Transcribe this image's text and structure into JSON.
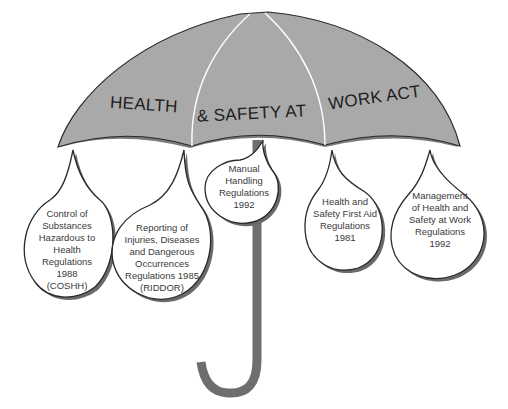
{
  "umbrella": {
    "title_parts": [
      "HEALTH",
      "& SAFETY AT",
      "WORK ACT"
    ],
    "colors": {
      "canopy": "#a9a9a9",
      "handle": "#6e6e6e",
      "outline": "#2a2a2a",
      "drop_fill": "#ffffff"
    }
  },
  "drops": [
    {
      "lines": [
        "Control of",
        "Substances",
        "Hazardous to",
        "Health",
        "Regulations",
        "1988",
        "(COSHH)"
      ]
    },
    {
      "lines": [
        "Reporting of",
        "Injuries, Diseases",
        "and Dangerous",
        "Occurrences",
        "Regulations 1985",
        "(RIDDOR)"
      ]
    },
    {
      "lines": [
        "Manual",
        "Handling",
        "Regulations",
        "1992"
      ]
    },
    {
      "lines": [
        "Health and",
        "Safety First Aid",
        "Regulations",
        "1981"
      ]
    },
    {
      "lines": [
        "Management",
        "of Health and",
        "Safety at Work",
        "Regulations",
        "1992"
      ]
    }
  ]
}
